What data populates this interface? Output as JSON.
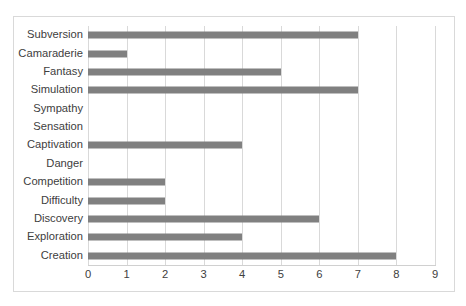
{
  "chart_data": {
    "type": "bar",
    "orientation": "horizontal",
    "title": "",
    "subtitle": "",
    "xlabel": "",
    "ylabel": "",
    "xlim": [
      0,
      9
    ],
    "xticks": [
      "0",
      "1",
      "2",
      "3",
      "4",
      "5",
      "6",
      "7",
      "8",
      "9"
    ],
    "grid": "vertical",
    "legend": "none",
    "bar_color": "#808080",
    "border_color": "#d9d9d9",
    "gridline_color": "#d9d9d9",
    "text_color": "#404040",
    "categories": [
      "Subversion",
      "Camaraderie",
      "Fantasy",
      "Simulation",
      "Sympathy",
      "Sensation",
      "Captivation",
      "Danger",
      "Competition",
      "Difficulty",
      "Discovery",
      "Exploration",
      "Creation"
    ],
    "values": [
      7,
      1,
      5,
      7,
      0,
      0,
      4,
      0,
      2,
      2,
      6,
      4,
      8
    ]
  }
}
